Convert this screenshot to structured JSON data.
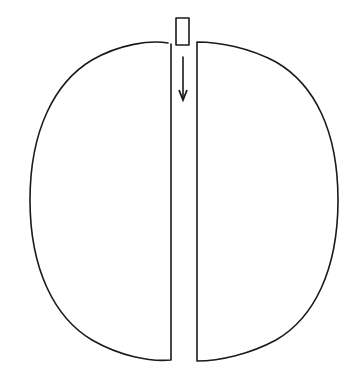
{
  "diagram": {
    "description": "Circle split vertically into two halves separated by a narrow gap; a small rectangle at the top of the gap with a downward arrow indicating movement down through the gap",
    "colors": {
      "line": "#1a1a1a",
      "background": "#ffffff"
    },
    "elements": {
      "left_half": {
        "label": "left-semicircle",
        "chord_x": 171,
        "top_y": 42,
        "bottom_y": 360,
        "leftmost_x": 30
      },
      "right_half": {
        "label": "right-semicircle",
        "chord_x": 197,
        "top_y": 42,
        "bottom_y": 360,
        "rightmost_x": 338
      },
      "block": {
        "label": "rectangle",
        "x": 176,
        "y": 18,
        "width": 13,
        "height": 27
      },
      "arrow": {
        "label": "downward-arrow",
        "x": 183,
        "y1": 57,
        "y2": 100,
        "direction": "down"
      }
    }
  }
}
